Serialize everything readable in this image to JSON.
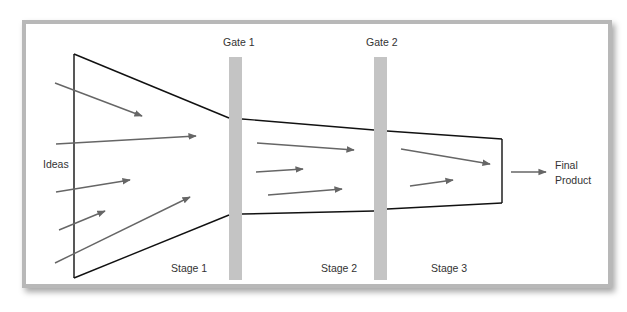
{
  "labels": {
    "gate1": "Gate 1",
    "gate2": "Gate 2",
    "ideas": "Ideas",
    "stage1": "Stage 1",
    "stage2": "Stage 2",
    "stage3": "Stage 3",
    "final_line1": "Final",
    "final_line2": "Product"
  },
  "colors": {
    "gate_fill": "#c4c4c4",
    "arrow": "#666666",
    "outline": "#111111",
    "frame_border": "#b8b8b8"
  }
}
